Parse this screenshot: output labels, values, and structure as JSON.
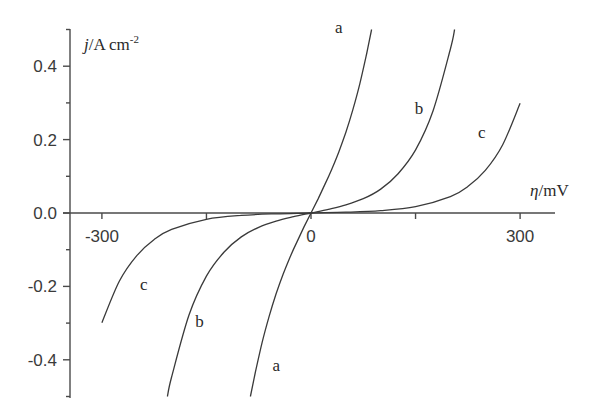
{
  "chart_data": {
    "type": "line",
    "title": "",
    "xlabel": "η/mV",
    "ylabel": "j/A cm-2",
    "xlabel_parts": {
      "symbol": "η",
      "unit": "/mV"
    },
    "ylabel_parts": {
      "symbol": "j",
      "unit": "/A cm",
      "exponent": "-2"
    },
    "xlim": [
      -340,
      350
    ],
    "ylim": [
      -0.5,
      0.5
    ],
    "x_ticks": [
      -300,
      -150,
      0,
      150,
      300
    ],
    "x_tick_labels": [
      "-300",
      "",
      "0",
      "",
      "300"
    ],
    "y_ticks": [
      -0.5,
      -0.4,
      -0.3,
      -0.2,
      -0.1,
      0.0,
      0.1,
      0.2,
      0.3,
      0.4,
      0.5
    ],
    "y_tick_labels": [
      "",
      "-0.4",
      "",
      "-0.2",
      "",
      "0.0",
      "",
      "0.2",
      "",
      "0.4",
      ""
    ],
    "grid": false,
    "legend": "inline curve labels",
    "series": [
      {
        "name": "a",
        "x": [
          -87,
          -80,
          -70,
          -60,
          -50,
          -40,
          -30,
          -20,
          -10,
          0,
          10,
          20,
          30,
          40,
          50,
          60,
          70,
          80,
          87
        ],
        "y": [
          -0.5,
          -0.436,
          -0.352,
          -0.281,
          -0.22,
          -0.167,
          -0.12,
          -0.078,
          -0.038,
          0,
          0.038,
          0.078,
          0.12,
          0.167,
          0.22,
          0.281,
          0.352,
          0.436,
          0.5
        ],
        "label_pos": {
          "above": [
            40,
            0.49
          ],
          "below": [
            -50,
            -0.43
          ]
        }
      },
      {
        "name": "b",
        "x": [
          -206,
          -200,
          -175,
          -150,
          -125,
          -100,
          -75,
          -50,
          -25,
          0,
          25,
          50,
          75,
          100,
          125,
          150,
          175,
          200,
          206
        ],
        "y": [
          -0.5,
          -0.447,
          -0.278,
          -0.172,
          -0.107,
          -0.065,
          -0.039,
          -0.022,
          -0.0099,
          0,
          0.0099,
          0.022,
          0.039,
          0.065,
          0.107,
          0.172,
          0.278,
          0.447,
          0.5
        ],
        "label_pos": {
          "above": [
            155,
            0.27
          ],
          "below": [
            -160,
            -0.31
          ]
        }
      },
      {
        "name": "c",
        "x": [
          -300,
          -275,
          -250,
          -225,
          -200,
          -150,
          -100,
          -50,
          0,
          50,
          100,
          150,
          200,
          225,
          250,
          275,
          300
        ],
        "y": [
          -0.299,
          -0.186,
          -0.116,
          -0.0718,
          -0.0447,
          -0.0172,
          -0.0065,
          -0.0022,
          0,
          0.0022,
          0.0065,
          0.0172,
          0.0447,
          0.0718,
          0.116,
          0.186,
          0.299
        ],
        "label_pos": {
          "above": [
            245,
            0.205
          ],
          "below": [
            -240,
            -0.21
          ]
        }
      }
    ]
  },
  "layout": {
    "origin_px": [
      311,
      213
    ],
    "px_per_mV": 0.697,
    "px_per_unit_j": 367,
    "x_axis_px": [
      63,
      555
    ],
    "y_axis_px": [
      29,
      398
    ],
    "y_axis_x_px": 70
  }
}
